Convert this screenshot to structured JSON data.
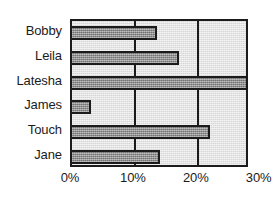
{
  "chart_data": {
    "type": "bar",
    "orientation": "horizontal",
    "title": "",
    "subtitle": "",
    "xlabel": "",
    "ylabel": "",
    "categories": [
      "Bobby",
      "Leila",
      "Latesha",
      "James",
      "Touch",
      "Jane"
    ],
    "values": [
      13.5,
      17,
      28,
      3,
      22,
      14
    ],
    "value_unit": "%",
    "xlim": [
      0,
      28.3
    ],
    "ylim": null,
    "x_ticks": [
      0,
      10,
      20,
      30
    ],
    "x_tick_labels": [
      "0%",
      "10%",
      "20%",
      "30%"
    ],
    "grid": "vertical-only",
    "legend": null,
    "legend_position": "none",
    "annotations": [],
    "series": [
      {
        "name": "",
        "values": [
          13.5,
          17,
          28,
          3,
          22,
          14
        ]
      }
    ]
  },
  "colors": {
    "bar_fill": "#8a8a8a",
    "bar_border": "#1b1b1b",
    "plot_background": "#d6d6d6",
    "frame": "#1b1b1b",
    "gridline": "#1b1b1b",
    "text": "#1b1b1b",
    "page_background": "#ffffff"
  }
}
